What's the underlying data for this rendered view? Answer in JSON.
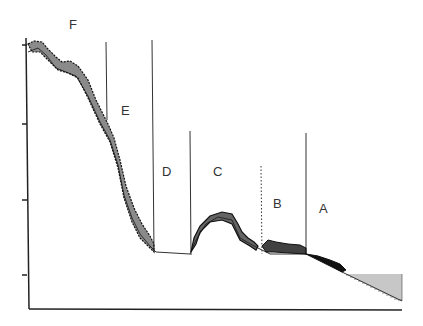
{
  "diagram": {
    "type": "profile-with-zones",
    "zones": [
      {
        "id": "F",
        "label": "F",
        "x": 73,
        "y": 28
      },
      {
        "id": "E",
        "label": "E",
        "x": 124,
        "y": 112
      },
      {
        "id": "D",
        "label": "D",
        "x": 165,
        "y": 172
      },
      {
        "id": "C",
        "label": "C",
        "x": 215,
        "y": 172
      },
      {
        "id": "B",
        "label": "B",
        "x": 274,
        "y": 205
      },
      {
        "id": "A",
        "label": "A",
        "x": 319,
        "y": 209
      }
    ],
    "boundaries": [
      {
        "x": 106,
        "y_top": 42,
        "y_bottom": 120,
        "style": "solid"
      },
      {
        "x": 152,
        "y_top": 40,
        "y_bottom": 252,
        "style": "solid"
      },
      {
        "x": 190,
        "y_top": 131,
        "y_bottom": 255,
        "style": "solid"
      },
      {
        "x": 261,
        "y_top": 166,
        "y_bottom": 254,
        "style": "dotted"
      },
      {
        "x": 306,
        "y_top": 133,
        "y_bottom": 255,
        "style": "solid"
      }
    ],
    "axes": {
      "y_ticks_count": 4,
      "x_axis": true,
      "y_axis": true
    },
    "water_hatch": true,
    "colors": {
      "line": "#222222",
      "hatch": "#444444"
    }
  }
}
